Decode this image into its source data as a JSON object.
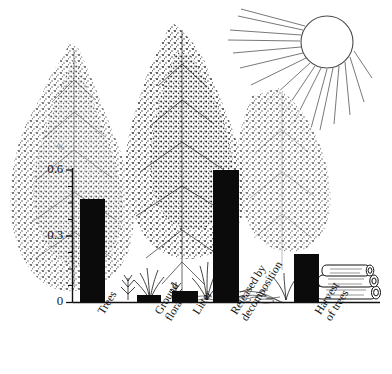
{
  "figure": {
    "title": "",
    "background_color": "#ffffff",
    "ink_color": "#0b0b0b"
  },
  "axis": {
    "y_ticks": [
      "0",
      "0.3",
      "0.6"
    ],
    "y_unit_mark": "%",
    "y_min": 0,
    "y_max": 0.6
  },
  "illustration": {
    "sun": "sun-with-rays",
    "trees": "conifer-trees",
    "ground": "ground-flora-and-litter",
    "logs": "stacked-harvested-logs"
  },
  "chart_data": {
    "type": "bar",
    "title": "",
    "xlabel": "",
    "ylabel": "%",
    "ylim": [
      0,
      0.6
    ],
    "yticks": [
      0,
      0.3,
      0.6
    ],
    "yticklabels": [
      "0",
      "0.3",
      "0.6"
    ],
    "minor_ticks": [
      0.075,
      0.15,
      0.225,
      0.375,
      0.45,
      0.525
    ],
    "grid": false,
    "legend": null,
    "bar_color": "#0b0b0b",
    "categories": [
      "Trees",
      "Ground\nflora",
      "Litter",
      "Released by\ndecomposition",
      "Harvest\nof trees"
    ],
    "values": [
      0.47,
      0.03,
      0.05,
      0.6,
      0.22
    ]
  }
}
